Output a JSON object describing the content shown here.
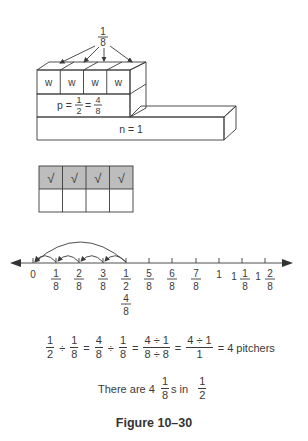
{
  "block_model": {
    "top_label": {
      "num": "1",
      "den": "8"
    },
    "w_cells": [
      "w",
      "w",
      "w",
      "w"
    ],
    "p_label": {
      "prefix": "p =",
      "f1_num": "1",
      "f1_den": "2",
      "eq": "=",
      "f2_num": "4",
      "f2_den": "8"
    },
    "n_label": "n = 1"
  },
  "grid": {
    "rows": [
      [
        "√",
        "√",
        "√",
        "√"
      ],
      [
        "",
        "",
        "",
        ""
      ]
    ],
    "shaded_color": "#bdbdbd"
  },
  "number_line": {
    "ticks": [
      {
        "whole": "0",
        "num": "",
        "den": ""
      },
      {
        "whole": "",
        "num": "1",
        "den": "8"
      },
      {
        "whole": "",
        "num": "2",
        "den": "8"
      },
      {
        "whole": "",
        "num": "3",
        "den": "8"
      },
      {
        "whole": "",
        "num": "1",
        "den": "2",
        "num2": "4",
        "den2": "8"
      },
      {
        "whole": "",
        "num": "5",
        "den": "8"
      },
      {
        "whole": "",
        "num": "6",
        "den": "8"
      },
      {
        "whole": "",
        "num": "7",
        "den": "8"
      },
      {
        "whole": "1",
        "num": "",
        "den": ""
      },
      {
        "whole": "1",
        "num": "1",
        "den": "8"
      },
      {
        "whole": "1",
        "num": "2",
        "den": "8"
      }
    ]
  },
  "equation": {
    "t1": {
      "num": "1",
      "den": "2"
    },
    "op1": "÷",
    "t2": {
      "num": "1",
      "den": "8"
    },
    "eq1": "=",
    "t3": {
      "num": "4",
      "den": "8"
    },
    "op2": "÷",
    "t4": {
      "num": "1",
      "den": "8"
    },
    "eq2": "=",
    "t5": {
      "num": "4 ÷ 1",
      "den": "8 ÷ 8"
    },
    "eq3": "=",
    "t6": {
      "num": "4 ÷ 1",
      "den": "1"
    },
    "eq4": "=",
    "result": "4 pitchers"
  },
  "sentence": {
    "prefix": "There are  4",
    "f1": {
      "num": "1",
      "den": "8"
    },
    "mid": "s  in",
    "f2": {
      "num": "1",
      "den": "2"
    }
  },
  "caption": "Figure 10–30"
}
